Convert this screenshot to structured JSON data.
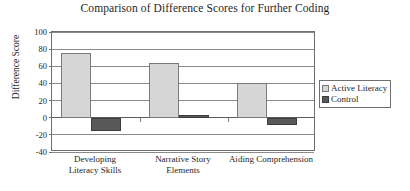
{
  "chart_data": {
    "type": "bar",
    "title": "Comparison of Difference Scores for Further Coding",
    "xlabel": "",
    "ylabel": "Difference Score",
    "categories": [
      "Developing Literacy Skills",
      "Narrative Story Elements",
      "Aiding Comprehension"
    ],
    "category_lines": [
      [
        "Developing",
        "Literacy Skills"
      ],
      [
        "Narrative Story",
        "Elements"
      ],
      [
        "Aiding Comprehension"
      ]
    ],
    "series": [
      {
        "name": "Active Literacy",
        "color": "#d6d6d6",
        "values": [
          76,
          64,
          41
        ]
      },
      {
        "name": "Control",
        "color": "#585858",
        "values": [
          -16,
          3,
          -8
        ]
      }
    ],
    "ylim": [
      -40,
      100
    ],
    "yticks": [
      100,
      80,
      60,
      40,
      20,
      0,
      -20,
      -40
    ],
    "ytick_labels": [
      "100",
      "80",
      "60",
      "40",
      "20",
      "0",
      "-20",
      "-40"
    ],
    "grid": true,
    "legend_position": "right",
    "legend_entries": [
      "Active Literacy",
      "Control"
    ]
  }
}
